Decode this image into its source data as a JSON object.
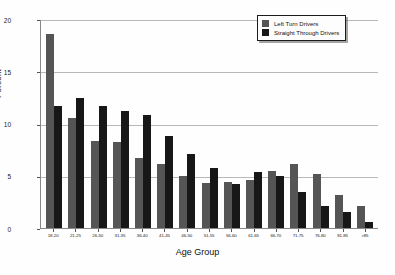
{
  "chart_data": {
    "type": "bar",
    "title": "",
    "xlabel": "Age Group",
    "ylabel": "Percent",
    "ylim": [
      0,
      20
    ],
    "yticks": [
      0,
      5,
      10,
      15,
      20
    ],
    "ytick_labels": [
      "0",
      "5",
      "10",
      "15",
      "20"
    ],
    "grid": true,
    "legend_position": "top-right",
    "categories": [
      "18-20",
      "21-25",
      "26-30",
      "31-35",
      "36-40",
      "41-45",
      "46-50",
      "51-55",
      "56-60",
      "61-65",
      "66-70",
      "71-75",
      "76-80",
      "81-85",
      ">85"
    ],
    "series": [
      {
        "name": "Left Turn Drivers",
        "color": "#555555",
        "values": [
          18.6,
          10.5,
          8.3,
          8.2,
          6.7,
          6.1,
          5.0,
          4.3,
          4.4,
          4.6,
          5.5,
          6.1,
          5.2,
          3.2,
          2.1
        ]
      },
      {
        "name": "Straight Through Drivers",
        "color": "#171717",
        "values": [
          11.7,
          12.4,
          11.7,
          11.2,
          10.8,
          8.8,
          7.1,
          5.7,
          4.2,
          5.4,
          5.0,
          3.4,
          2.1,
          1.5,
          0.6
        ]
      }
    ]
  },
  "legend": {
    "entries": [
      {
        "label": "Left Turn Drivers",
        "swatch": "left"
      },
      {
        "label": "Straight  Through Drivers",
        "swatch": "straight"
      }
    ]
  }
}
